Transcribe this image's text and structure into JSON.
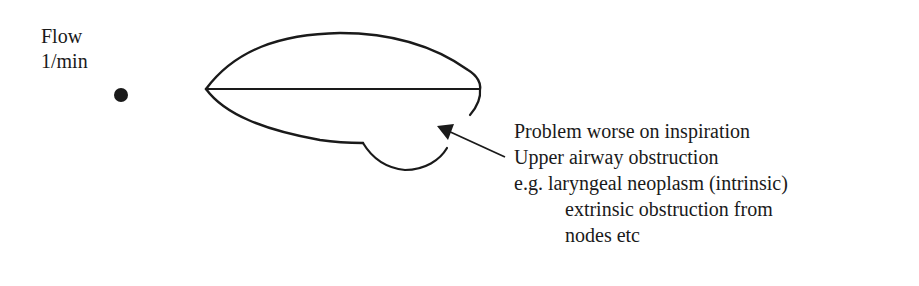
{
  "diagram": {
    "type": "flow-volume-loop",
    "axis_label": {
      "line1": "Flow",
      "line2": "1/min"
    },
    "annotation": {
      "lines": [
        "Problem worse on inspiration",
        "Upper airway obstruction",
        "e.g. laryngeal neoplasm (intrinsic)",
        "extrinsic obstruction from",
        "nodes etc"
      ]
    },
    "colors": {
      "stroke": "#1a1a1a",
      "background": "#ffffff"
    }
  }
}
